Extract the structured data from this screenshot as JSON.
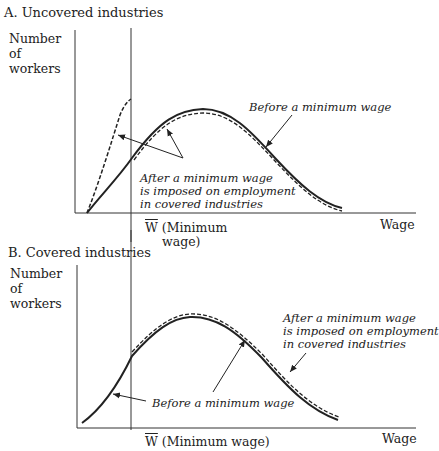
{
  "panel_a": {
    "title": "A. Uncovered industries",
    "ylabel": "Number of workers",
    "xlabel": "Wage",
    "min_wage_symbol": "W",
    "min_wage_label_1": "(Minimum",
    "min_wage_label_2": "wage)",
    "annotation_before": "Before a minimum wage",
    "annotation_after": [
      "After a minimum wage",
      "is imposed on employment",
      "in covered industries"
    ]
  },
  "panel_b": {
    "title": "B. Covered industries",
    "ylabel": "Number of workers",
    "xlabel": "Wage",
    "min_wage_symbol": "W",
    "min_wage_label": "(Minimum wage)",
    "annotation_before": "Before a minimum wage",
    "annotation_after": [
      "After a minimum wage",
      "is imposed on employment",
      "in covered industries"
    ]
  },
  "legend": {
    "solid": "Before a minimum wage",
    "dashed": "After a minimum wage is imposed on employment in covered industries"
  }
}
